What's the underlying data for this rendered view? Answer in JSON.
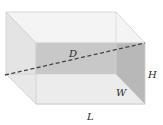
{
  "figure": {
    "labels": {
      "diagonal": "D",
      "width": "W",
      "height": "H",
      "length": "L"
    },
    "colors": {
      "top_face": "#f3f3f3",
      "left_face": "#e6e6e6",
      "bottom_face": "#e9e9e9",
      "front_face": "#f0f0f0",
      "diagonal_plane": "#bdbdbd",
      "right_plane": "#a8a8a8",
      "edge": "#c8c8c8",
      "dashed_line": "#4a4a4a"
    }
  }
}
